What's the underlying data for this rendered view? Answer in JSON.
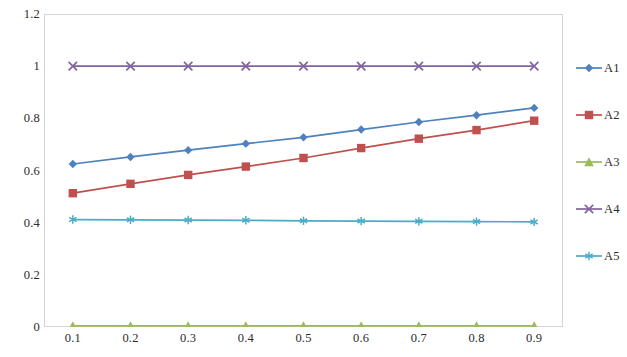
{
  "chart_data": {
    "type": "line",
    "title": "",
    "subtitle": "",
    "xlabel": "",
    "ylabel": "",
    "x": [
      0.1,
      0.2,
      0.3,
      0.4,
      0.5,
      0.6,
      0.7,
      0.8,
      0.9
    ],
    "xlim": [
      0.05,
      0.95
    ],
    "ylim": [
      0,
      1.2
    ],
    "y_ticks": [
      "0",
      "0.2",
      "0.4",
      "0.6",
      "0.8",
      "1",
      "1.2"
    ],
    "y_tick_values": [
      0,
      0.2,
      0.4,
      0.6,
      0.8,
      1,
      1.2
    ],
    "x_ticks": [
      "0.1",
      "0.2",
      "0.3",
      "0.4",
      "0.5",
      "0.6",
      "0.7",
      "0.8",
      "0.9"
    ],
    "grid": false,
    "legend_position": "right",
    "series": [
      {
        "name": "A1",
        "color": "#4f81bd",
        "marker": "diamond",
        "values": [
          0.625,
          0.652,
          0.678,
          0.703,
          0.727,
          0.757,
          0.786,
          0.812,
          0.84
        ]
      },
      {
        "name": "A2",
        "color": "#c0504d",
        "marker": "square",
        "values": [
          0.513,
          0.549,
          0.583,
          0.615,
          0.648,
          0.686,
          0.722,
          0.755,
          0.791
        ]
      },
      {
        "name": "A3",
        "color": "#9bbb59",
        "marker": "triangle",
        "values": [
          0.004,
          0.004,
          0.004,
          0.004,
          0.004,
          0.004,
          0.004,
          0.004,
          0.004
        ]
      },
      {
        "name": "A4",
        "color": "#8064a2",
        "marker": "x",
        "values": [
          1.0,
          1.0,
          1.0,
          1.0,
          1.0,
          1.0,
          1.0,
          1.0,
          1.0
        ]
      },
      {
        "name": "A5",
        "color": "#4bacc6",
        "marker": "asterisk",
        "values": [
          0.412,
          0.411,
          0.41,
          0.409,
          0.407,
          0.406,
          0.405,
          0.404,
          0.403
        ]
      }
    ]
  },
  "legend": {
    "items": [
      {
        "label": "A1"
      },
      {
        "label": "A2"
      },
      {
        "label": "A3"
      },
      {
        "label": "A4"
      },
      {
        "label": "A5"
      }
    ]
  },
  "plot": {
    "border_color": "#d4d4d4",
    "background": "#ffffff"
  }
}
